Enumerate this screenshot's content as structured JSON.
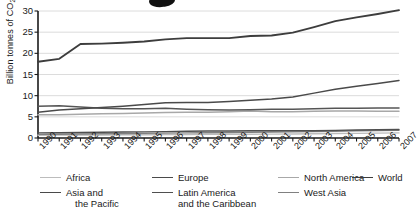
{
  "chart_data": {
    "type": "line",
    "title": "",
    "xlabel": "",
    "ylabel": "Billion tonnes of CO2",
    "ylabel_display": "Billion tonnes of CO",
    "ylabel_sub": "2",
    "ylim": [
      0,
      30
    ],
    "yticks": [
      0,
      5,
      10,
      15,
      20,
      25,
      30
    ],
    "grid": "horizontal",
    "legend_position": "bottom",
    "categories": [
      "1990",
      "1991",
      "1992",
      "1993",
      "1994",
      "1995",
      "1996",
      "1997",
      "1998",
      "1999",
      "2000",
      "2001",
      "2002",
      "2003",
      "2004",
      "2005",
      "2006",
      "2007"
    ],
    "x": [
      1990,
      1991,
      1992,
      1993,
      1994,
      1995,
      1996,
      1997,
      1998,
      1999,
      2000,
      2001,
      2002,
      2003,
      2004,
      2005,
      2006,
      2007
    ],
    "series": [
      {
        "name": "World",
        "color": "#3d3d3d",
        "width": 1.9,
        "values": [
          18.0,
          18.7,
          22.2,
          22.3,
          22.5,
          22.8,
          23.3,
          23.6,
          23.6,
          23.6,
          24.1,
          24.2,
          24.9,
          26.2,
          27.6,
          28.5,
          29.3,
          30.2
        ]
      },
      {
        "name": "Asia and the Pacific",
        "color": "#4a4a4a",
        "width": 1.5,
        "values": [
          6.1,
          6.6,
          6.9,
          7.2,
          7.5,
          7.9,
          8.3,
          8.4,
          8.4,
          8.6,
          8.9,
          9.2,
          9.7,
          10.6,
          11.5,
          12.2,
          12.9,
          13.6
        ]
      },
      {
        "name": "Europe",
        "color": "#555555",
        "width": 1.5,
        "values": [
          7.5,
          7.6,
          7.3,
          7.0,
          6.9,
          6.9,
          7.0,
          6.8,
          6.7,
          6.6,
          6.7,
          6.8,
          6.8,
          6.9,
          7.0,
          7.0,
          7.1,
          7.1
        ]
      },
      {
        "name": "North America",
        "color": "#a8a8a8",
        "width": 1.5,
        "values": [
          5.5,
          5.5,
          5.6,
          5.7,
          5.8,
          5.9,
          6.0,
          6.1,
          6.1,
          6.2,
          6.4,
          6.2,
          6.2,
          6.3,
          6.4,
          6.4,
          6.3,
          6.3
        ]
      },
      {
        "name": "Latin America and the Caribbean",
        "color": "#4f4f4f",
        "width": 1.4,
        "values": [
          1.2,
          1.25,
          1.3,
          1.35,
          1.4,
          1.45,
          1.5,
          1.6,
          1.65,
          1.65,
          1.7,
          1.7,
          1.7,
          1.7,
          1.8,
          1.9,
          1.95,
          2.0
        ]
      },
      {
        "name": "West Asia",
        "color": "#808080",
        "width": 1.4,
        "values": [
          0.85,
          0.9,
          0.95,
          1.0,
          1.05,
          1.1,
          1.15,
          1.2,
          1.25,
          1.3,
          1.35,
          1.4,
          1.45,
          1.5,
          1.6,
          1.7,
          1.75,
          1.8
        ]
      },
      {
        "name": "Africa",
        "color": "#bcbcbc",
        "width": 1.4,
        "values": [
          0.65,
          0.68,
          0.7,
          0.72,
          0.75,
          0.78,
          0.8,
          0.82,
          0.85,
          0.88,
          0.9,
          0.92,
          0.95,
          1.0,
          1.05,
          1.1,
          1.15,
          1.2
        ]
      }
    ]
  },
  "legend": {
    "entries": [
      {
        "label": "Africa",
        "label2": "",
        "color": "#bcbcbc",
        "width": 1.4
      },
      {
        "label": "Asia and",
        "label2": "the Pacific",
        "color": "#4a4a4a",
        "width": 1.9
      },
      {
        "label": "Europe",
        "label2": "",
        "color": "#4a4a4a",
        "width": 1.9
      },
      {
        "label": "Latin America",
        "label2": "and the Caribbean",
        "color": "#4f4f4f",
        "width": 1.7
      },
      {
        "label": "North America",
        "label2": "",
        "color": "#a8a8a8",
        "width": 1.7
      },
      {
        "label": "West Asia",
        "label2": "",
        "color": "#808080",
        "width": 1.7
      },
      {
        "label": "World",
        "label2": "",
        "color": "#3d3d3d",
        "width": 1.9
      }
    ]
  },
  "axes": {
    "y_tick_labels": [
      "0",
      "5",
      "10",
      "15",
      "20",
      "25",
      "30"
    ],
    "x_tick_labels": [
      "1990",
      "1991",
      "1992",
      "1993",
      "1994",
      "1995",
      "1996",
      "1997",
      "1998",
      "1999",
      "2000",
      "2001",
      "2002",
      "2003",
      "2004",
      "2005",
      "2006",
      "2007"
    ]
  }
}
